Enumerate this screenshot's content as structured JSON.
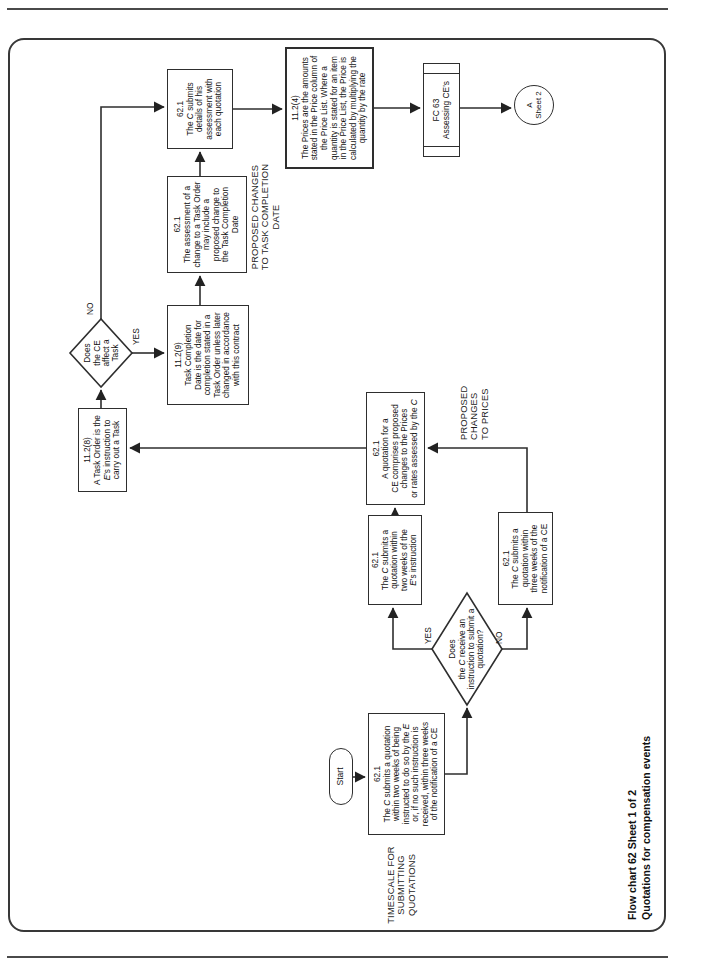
{
  "colors": {
    "paper": "#ffffff",
    "line": "#2e2e2e",
    "text": "#111111"
  },
  "branch_labels": {
    "yes": "YES",
    "no": "NO"
  },
  "section_labels": {
    "timescale": [
      "TIMESCALE FOR",
      "SUBMITTING",
      "QUOTATIONS"
    ],
    "proposed_prices": [
      "PROPOSED",
      "CHANGES",
      "TO PRICES"
    ],
    "proposed_completion": [
      "PROPOSED CHANGES",
      "TO TASK COMPLETION",
      "DATE"
    ]
  },
  "caption": {
    "lines": [
      "Flow chart 62 Sheet 1 of 2",
      "Quotations for compensation events"
    ]
  },
  "nodes": {
    "start": {
      "label": "Start"
    },
    "timescale": {
      "lines": [
        "62.1",
        "The *C* submits a quotation",
        "within two weeks of being",
        "instructed to do so by the *E*",
        "or, if no such instruction is",
        "received, within three weeks",
        "of the notification of a CE"
      ]
    },
    "receive_decision": {
      "lines": [
        "Does",
        "the *C* receive an",
        "instruction to submit a",
        "quotation?"
      ]
    },
    "two_weeks": {
      "lines": [
        "62.1",
        "The *C* submits a",
        "quotation within",
        "two weeks of the",
        "*E*'s instruction"
      ]
    },
    "three_weeks": {
      "lines": [
        "62.1",
        "The *C* submits a",
        "quotation within",
        "three weeks of the",
        "notification of a CE"
      ]
    },
    "quotation_comprises": {
      "lines": [
        "62.1",
        "A quotation for a",
        "CE comprises proposed",
        "changes to the Prices",
        "or rates assessed by the *C*"
      ]
    },
    "task_order": {
      "lines": [
        "11.2(8)",
        "A Task Order is the",
        "*E*'s instruction to",
        "carry out a Task"
      ]
    },
    "affect_decision": {
      "lines": [
        "Does",
        "the CE",
        "affect a",
        "Task"
      ]
    },
    "completion_date": {
      "lines": [
        "11.2(9)",
        "Task Completion",
        "Date is the date for",
        "completion stated in a",
        "Task Order unless later",
        "changed in accordance",
        "with this contract"
      ]
    },
    "assessment": {
      "lines": [
        "62.1",
        "The assessment of a",
        "change to a Task Order",
        "may include a",
        "proposed change to",
        "the Task Completion",
        "Date"
      ]
    },
    "submits_details": {
      "lines": [
        "62.1",
        "The *C* submits",
        "details of his",
        "assessment with",
        "each quotation"
      ]
    },
    "prices": {
      "lines": [
        "11.2(4)",
        "The Prices are the amounts",
        "stated in the Price column of",
        "the Price List. Where a",
        "quantity is stated for an item",
        "in the Price List, the Price is",
        "calculated by multiplying the",
        "quantity by the rate"
      ]
    },
    "fc63": {
      "lines": [
        "FC 63",
        "Assessing CE's"
      ]
    },
    "sheet2": {
      "lines": [
        "A",
        "Sheet 2"
      ]
    }
  }
}
